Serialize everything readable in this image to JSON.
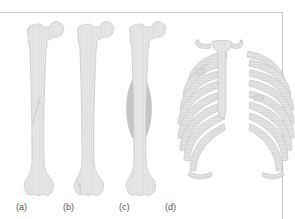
{
  "figure": {
    "panels": [
      {
        "id": "a",
        "label": "(a)",
        "subject": "femur with spiral fracture line"
      },
      {
        "id": "b",
        "label": "(b)",
        "subject": "femur with fracture at distal end"
      },
      {
        "id": "c",
        "label": "(c)",
        "subject": "femur with swelling around shaft"
      },
      {
        "id": "d",
        "label": "(d)",
        "subject": "rib cage with rib fractures"
      }
    ],
    "colors": {
      "bone_fill": "#e6e6e6",
      "bone_stroke": "#c4c4c4",
      "hatch": "#d2d2d2",
      "swelling": "#a8a8a8",
      "frame": "#c8c8c8",
      "label_text": "#555555"
    }
  }
}
